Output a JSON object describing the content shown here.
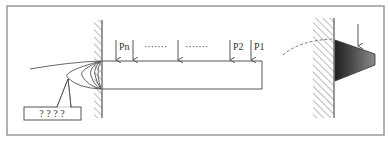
{
  "diagram": {
    "loads": [
      {
        "label": "Pn",
        "x": 116
      },
      {
        "label": "",
        "x": 133
      },
      {
        "label": "",
        "x": 178
      },
      {
        "label": "P2",
        "x": 230
      },
      {
        "label": "P1",
        "x": 251
      }
    ],
    "ellipsis_1": "·······",
    "ellipsis_2": "·······",
    "callout_text": "? ? ? ?",
    "colors": {
      "line": "#555555",
      "frame": "#888888",
      "hatch": "#777777",
      "trapezoid_dark": "#1e1e1e",
      "trapezoid_light": "#8a8a8a"
    }
  }
}
